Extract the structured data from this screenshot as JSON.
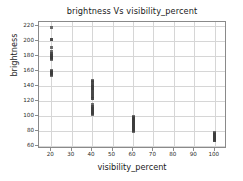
{
  "chart_data": {
    "type": "scatter",
    "title": "brightness Vs visibility_percent",
    "xlabel": "visibility_percent",
    "ylabel": "brightness",
    "xlim": [
      14,
      106
    ],
    "ylim": [
      56,
      226
    ],
    "xticks": [
      20,
      30,
      40,
      50,
      60,
      70,
      80,
      90,
      100
    ],
    "yticks": [
      60,
      80,
      100,
      120,
      140,
      160,
      180,
      200,
      220
    ],
    "grid": true,
    "legend": null,
    "marker": "square",
    "marker_color": "#3b3b3b",
    "points": [
      {
        "x": 20,
        "y": 218
      },
      {
        "x": 20,
        "y": 203
      },
      {
        "x": 20,
        "y": 202
      },
      {
        "x": 20,
        "y": 192
      },
      {
        "x": 20,
        "y": 186
      },
      {
        "x": 20,
        "y": 184
      },
      {
        "x": 20,
        "y": 183
      },
      {
        "x": 20,
        "y": 181
      },
      {
        "x": 20,
        "y": 180
      },
      {
        "x": 20,
        "y": 179
      },
      {
        "x": 20,
        "y": 178
      },
      {
        "x": 20,
        "y": 177
      },
      {
        "x": 20,
        "y": 176
      },
      {
        "x": 20,
        "y": 161
      },
      {
        "x": 20,
        "y": 160
      },
      {
        "x": 20,
        "y": 159
      },
      {
        "x": 20,
        "y": 158
      },
      {
        "x": 20,
        "y": 157
      },
      {
        "x": 20,
        "y": 156
      },
      {
        "x": 20,
        "y": 155
      },
      {
        "x": 40,
        "y": 148
      },
      {
        "x": 40,
        "y": 147
      },
      {
        "x": 40,
        "y": 145
      },
      {
        "x": 40,
        "y": 143
      },
      {
        "x": 40,
        "y": 141
      },
      {
        "x": 40,
        "y": 139
      },
      {
        "x": 40,
        "y": 138
      },
      {
        "x": 40,
        "y": 137
      },
      {
        "x": 40,
        "y": 135
      },
      {
        "x": 40,
        "y": 134
      },
      {
        "x": 40,
        "y": 132
      },
      {
        "x": 40,
        "y": 130
      },
      {
        "x": 40,
        "y": 128
      },
      {
        "x": 40,
        "y": 126
      },
      {
        "x": 40,
        "y": 124
      },
      {
        "x": 40,
        "y": 123
      },
      {
        "x": 40,
        "y": 115
      },
      {
        "x": 40,
        "y": 113
      },
      {
        "x": 40,
        "y": 112
      },
      {
        "x": 40,
        "y": 110
      },
      {
        "x": 40,
        "y": 109
      },
      {
        "x": 40,
        "y": 108
      },
      {
        "x": 40,
        "y": 106
      },
      {
        "x": 40,
        "y": 105
      },
      {
        "x": 40,
        "y": 104
      },
      {
        "x": 40,
        "y": 102
      },
      {
        "x": 60,
        "y": 99
      },
      {
        "x": 60,
        "y": 98
      },
      {
        "x": 60,
        "y": 97
      },
      {
        "x": 60,
        "y": 96
      },
      {
        "x": 60,
        "y": 95
      },
      {
        "x": 60,
        "y": 94
      },
      {
        "x": 60,
        "y": 93
      },
      {
        "x": 60,
        "y": 92
      },
      {
        "x": 60,
        "y": 91
      },
      {
        "x": 60,
        "y": 90
      },
      {
        "x": 60,
        "y": 89
      },
      {
        "x": 60,
        "y": 88
      },
      {
        "x": 60,
        "y": 87
      },
      {
        "x": 60,
        "y": 86
      },
      {
        "x": 60,
        "y": 85
      },
      {
        "x": 60,
        "y": 84
      },
      {
        "x": 60,
        "y": 83
      },
      {
        "x": 60,
        "y": 82
      },
      {
        "x": 60,
        "y": 81
      },
      {
        "x": 60,
        "y": 80
      },
      {
        "x": 100,
        "y": 78
      },
      {
        "x": 100,
        "y": 77
      },
      {
        "x": 100,
        "y": 76
      },
      {
        "x": 100,
        "y": 75
      },
      {
        "x": 100,
        "y": 74
      },
      {
        "x": 100,
        "y": 73
      },
      {
        "x": 100,
        "y": 72
      },
      {
        "x": 100,
        "y": 71
      },
      {
        "x": 100,
        "y": 70
      },
      {
        "x": 100,
        "y": 69
      },
      {
        "x": 100,
        "y": 68
      },
      {
        "x": 100,
        "y": 67
      }
    ]
  }
}
